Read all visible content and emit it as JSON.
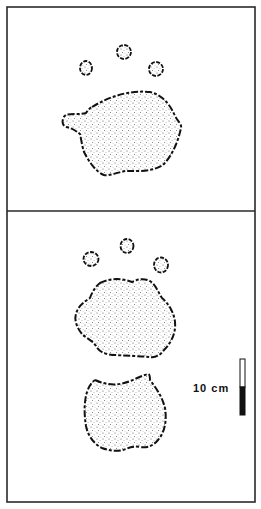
{
  "figure": {
    "panels": [
      {
        "id": "top",
        "description": "footprint with three toe pads and a main pad",
        "toe_count": 3
      },
      {
        "id": "bottom",
        "description": "footprint with three toe pads, a main pad and a separate heel pad",
        "toe_count": 3
      }
    ],
    "scale_bar": {
      "label": "10 cm",
      "segments": [
        "white",
        "black"
      ]
    },
    "colors": {
      "ink": "#111111",
      "frame": "#2a2a2a",
      "background": "#ffffff"
    }
  }
}
